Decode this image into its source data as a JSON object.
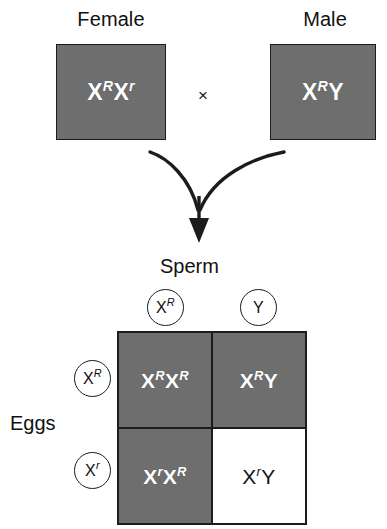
{
  "diagram": {
    "type": "punnett-square-cross",
    "parents": {
      "female": {
        "label": "Female",
        "genotype": {
          "allele1": {
            "base": "X",
            "sup": "R"
          },
          "allele2": {
            "base": "X",
            "sup": "r"
          }
        },
        "shaded": true
      },
      "male": {
        "label": "Male",
        "genotype": {
          "allele1": {
            "base": "X",
            "sup": "R"
          },
          "allele2": {
            "base": "Y",
            "sup": ""
          }
        },
        "shaded": true
      },
      "cross_symbol": "×"
    },
    "gametes": {
      "sperm_label": "Sperm",
      "eggs_label": "Eggs",
      "sperm": [
        {
          "base": "X",
          "sup": "R"
        },
        {
          "base": "Y",
          "sup": ""
        }
      ],
      "eggs": [
        {
          "base": "X",
          "sup": "R"
        },
        {
          "base": "X",
          "sup": "r"
        }
      ]
    },
    "offspring": [
      {
        "cell": "top-left",
        "allele1": {
          "base": "X",
          "sup": "R"
        },
        "allele2": {
          "base": "X",
          "sup": "R"
        },
        "shaded": true
      },
      {
        "cell": "top-right",
        "allele1": {
          "base": "X",
          "sup": "R"
        },
        "allele2": {
          "base": "Y",
          "sup": ""
        },
        "shaded": true
      },
      {
        "cell": "bottom-left",
        "allele1": {
          "base": "X",
          "sup": "r"
        },
        "allele2": {
          "base": "X",
          "sup": "R"
        },
        "shaded": true
      },
      {
        "cell": "bottom-right",
        "allele1": {
          "base": "X",
          "sup": "r"
        },
        "allele2": {
          "base": "Y",
          "sup": ""
        },
        "shaded": false
      }
    ],
    "colors": {
      "shaded_fill": "#6e6e6e",
      "plain_fill": "#ffffff",
      "line": "#1c1c1c",
      "shaded_text": "#ffffff",
      "plain_text": "#141414"
    }
  }
}
